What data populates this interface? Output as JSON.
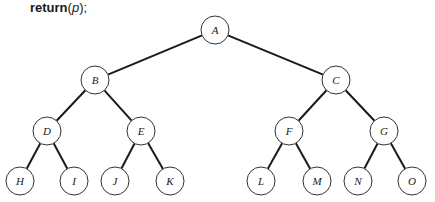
{
  "code_line": {
    "keyword": "return",
    "open": "(",
    "arg": "p",
    "close": ");"
  },
  "tree": {
    "node_radius": 14,
    "nodes": [
      {
        "id": "A",
        "label": "A",
        "x": 215,
        "y": 30
      },
      {
        "id": "B",
        "label": "B",
        "x": 95,
        "y": 80
      },
      {
        "id": "C",
        "label": "C",
        "x": 336,
        "y": 80
      },
      {
        "id": "D",
        "label": "D",
        "x": 47,
        "y": 131
      },
      {
        "id": "E",
        "label": "E",
        "x": 141,
        "y": 131
      },
      {
        "id": "F",
        "label": "F",
        "x": 289,
        "y": 131
      },
      {
        "id": "G",
        "label": "G",
        "x": 384,
        "y": 131
      },
      {
        "id": "H",
        "label": "H",
        "x": 20,
        "y": 181
      },
      {
        "id": "I",
        "label": "I",
        "x": 74,
        "y": 181
      },
      {
        "id": "J",
        "label": "J",
        "x": 115,
        "y": 181
      },
      {
        "id": "K",
        "label": "K",
        "x": 170,
        "y": 181
      },
      {
        "id": "L",
        "label": "L",
        "x": 261,
        "y": 181
      },
      {
        "id": "M",
        "label": "M",
        "x": 317,
        "y": 181
      },
      {
        "id": "N",
        "label": "N",
        "x": 358,
        "y": 181
      },
      {
        "id": "O",
        "label": "O",
        "x": 412,
        "y": 181
      }
    ],
    "edges": [
      [
        "A",
        "B"
      ],
      [
        "A",
        "C"
      ],
      [
        "B",
        "D"
      ],
      [
        "B",
        "E"
      ],
      [
        "C",
        "F"
      ],
      [
        "C",
        "G"
      ],
      [
        "D",
        "H"
      ],
      [
        "D",
        "I"
      ],
      [
        "E",
        "J"
      ],
      [
        "E",
        "K"
      ],
      [
        "F",
        "L"
      ],
      [
        "F",
        "M"
      ],
      [
        "G",
        "N"
      ],
      [
        "G",
        "O"
      ]
    ]
  }
}
